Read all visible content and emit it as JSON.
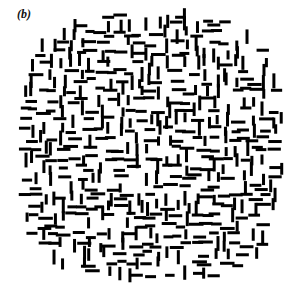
{
  "figure": {
    "panel_label": "(b)",
    "type": "texture-stimulus-field",
    "width": 291,
    "height": 292,
    "background_color": "#ffffff",
    "element_color": "#000000"
  },
  "chart_data": {
    "type": "scatter",
    "title": "(b)",
    "xlabel": "",
    "ylabel": "",
    "xlim": [
      0,
      291
    ],
    "ylim": [
      0,
      292
    ],
    "grid": false,
    "legend": null,
    "field": {
      "shape": "superellipse",
      "center_x": 151,
      "center_y": 147,
      "radius_x": 131,
      "radius_y": 133,
      "exponent": 3.2
    },
    "marker": {
      "shape": "bar",
      "length_min": 9,
      "length_max": 15,
      "thickness": 3,
      "orientations": [
        "horizontal",
        "vertical"
      ]
    },
    "counts": {
      "total_segments": 760,
      "horizontal": 380,
      "vertical": 380
    },
    "seed": 20240517,
    "cell_size": 9.6,
    "jitter": 3.1,
    "fill_probability": 0.78
  }
}
